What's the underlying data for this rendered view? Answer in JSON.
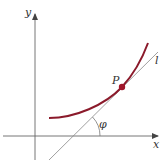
{
  "diagram": {
    "type": "tangent-line-to-curve",
    "labels": {
      "x_axis": "x",
      "y_axis": "y",
      "point": "P",
      "tangent_line": "l",
      "angle": "φ"
    },
    "colors": {
      "curve": "#8b1a2b",
      "point": "#a0152a",
      "axes": "#555555",
      "tangent": "#777777",
      "background": "#ffffff"
    },
    "elements": {
      "x_axis": {
        "from": [
          3,
          136
        ],
        "to": [
          160,
          136
        ]
      },
      "y_axis": {
        "from": [
          35,
          160
        ],
        "to": [
          35,
          12
        ]
      },
      "curve": {
        "start": [
          49,
          118
        ],
        "through": [
          122,
          87
        ],
        "end": [
          148,
          43
        ]
      },
      "point_P": {
        "x": 122,
        "y": 87
      },
      "tangent_line_l": {
        "from": [
          49,
          160
        ],
        "to": [
          158,
          52
        ]
      },
      "angle_phi": {
        "vertex": [
          73,
          136
        ],
        "arc_radius": 27
      }
    }
  }
}
